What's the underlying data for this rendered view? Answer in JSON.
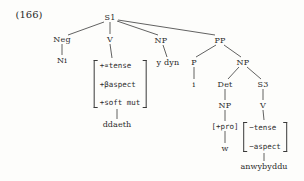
{
  "figure": {
    "example_number": "(166)",
    "caption_sentence": "Ni ddaeth y dyn i [+pro] w anwybyddu",
    "nodes": [
      {
        "name": "s1",
        "label": "S1",
        "x": 110,
        "y": 17
      },
      {
        "name": "neg",
        "label": "Neg",
        "x": 62,
        "y": 39
      },
      {
        "name": "ni",
        "label": "Ni",
        "x": 62,
        "y": 60
      },
      {
        "name": "v-matrix",
        "label": "V",
        "x": 110,
        "y": 39
      },
      {
        "name": "np-subj",
        "label": "NP",
        "x": 161,
        "y": 40
      },
      {
        "name": "y-dyn",
        "label": "y dyn",
        "x": 168,
        "y": 62
      },
      {
        "name": "pp",
        "label": "PP",
        "x": 220,
        "y": 40
      },
      {
        "name": "p",
        "label": "P",
        "x": 194,
        "y": 62
      },
      {
        "name": "i",
        "label": "i",
        "x": 194,
        "y": 84
      },
      {
        "name": "np-pp",
        "label": "NP",
        "x": 243,
        "y": 62
      },
      {
        "name": "det",
        "label": "Det",
        "x": 225,
        "y": 84
      },
      {
        "name": "np-det",
        "label": "NP",
        "x": 225,
        "y": 105
      },
      {
        "name": "s3",
        "label": "S3",
        "x": 263,
        "y": 84
      },
      {
        "name": "v-embedded",
        "label": "V",
        "x": 263,
        "y": 105
      }
    ],
    "feature_matrices": [
      {
        "name": "matrix-main-verb",
        "x": 120,
        "y": 84,
        "size": "tall",
        "rows": [
          "+∝tense",
          "+βaspect",
          "+soft mut"
        ],
        "terminal": {
          "label": "ddaeth",
          "x": 117,
          "y": 124
        }
      },
      {
        "name": "matrix-embedded-verb",
        "x": 265,
        "y": 137,
        "size": "short",
        "rows": [
          "−tense",
          "−aspect"
        ],
        "terminal": {
          "label": "anwybyddu",
          "x": 264,
          "y": 166
        }
      }
    ],
    "inline_features": [
      {
        "name": "pro-feature",
        "label": "[+pro]",
        "x": 225,
        "y": 126
      }
    ],
    "leaf_words": [
      {
        "name": "leaf-w",
        "label": "w",
        "x": 225,
        "y": 148
      }
    ],
    "edges": [
      {
        "name": "edge-s1-neg",
        "x1": 104,
        "y1": 22,
        "x2": 68,
        "y2": 35
      },
      {
        "name": "edge-s1-v",
        "x1": 110,
        "y1": 22,
        "x2": 110,
        "y2": 34
      },
      {
        "name": "edge-s1-np",
        "x1": 117,
        "y1": 21,
        "x2": 158,
        "y2": 35
      },
      {
        "name": "edge-s1-pp",
        "x1": 118,
        "y1": 20,
        "x2": 215,
        "y2": 35
      },
      {
        "name": "edge-neg-ni",
        "x1": 62,
        "y1": 44,
        "x2": 62,
        "y2": 55
      },
      {
        "name": "edge-v-matrix",
        "x1": 110,
        "y1": 44,
        "x2": 112,
        "y2": 58
      },
      {
        "name": "edge-np-ydyn",
        "x1": 163,
        "y1": 45,
        "x2": 167,
        "y2": 57
      },
      {
        "name": "edge-pp-p",
        "x1": 216,
        "y1": 45,
        "x2": 196,
        "y2": 57
      },
      {
        "name": "edge-pp-np",
        "x1": 224,
        "y1": 45,
        "x2": 241,
        "y2": 57
      },
      {
        "name": "edge-p-i",
        "x1": 194,
        "y1": 67,
        "x2": 194,
        "y2": 79
      },
      {
        "name": "edge-np-det",
        "x1": 239,
        "y1": 67,
        "x2": 228,
        "y2": 79
      },
      {
        "name": "edge-np-s3",
        "x1": 247,
        "y1": 67,
        "x2": 261,
        "y2": 79
      },
      {
        "name": "edge-det-np",
        "x1": 225,
        "y1": 89,
        "x2": 225,
        "y2": 100
      },
      {
        "name": "edge-s3-v",
        "x1": 263,
        "y1": 89,
        "x2": 263,
        "y2": 100
      },
      {
        "name": "edge-np-pro",
        "x1": 225,
        "y1": 110,
        "x2": 225,
        "y2": 121
      },
      {
        "name": "edge-pro-w",
        "x1": 225,
        "y1": 131,
        "x2": 225,
        "y2": 143
      },
      {
        "name": "edge-v-emb",
        "x1": 263,
        "y1": 110,
        "x2": 264,
        "y2": 120
      },
      {
        "name": "edge-matrix-ddaeth",
        "x1": 117,
        "y1": 109,
        "x2": 117,
        "y2": 119
      },
      {
        "name": "edge-matrix-anwy",
        "x1": 264,
        "y1": 153,
        "x2": 264,
        "y2": 161
      }
    ]
  }
}
